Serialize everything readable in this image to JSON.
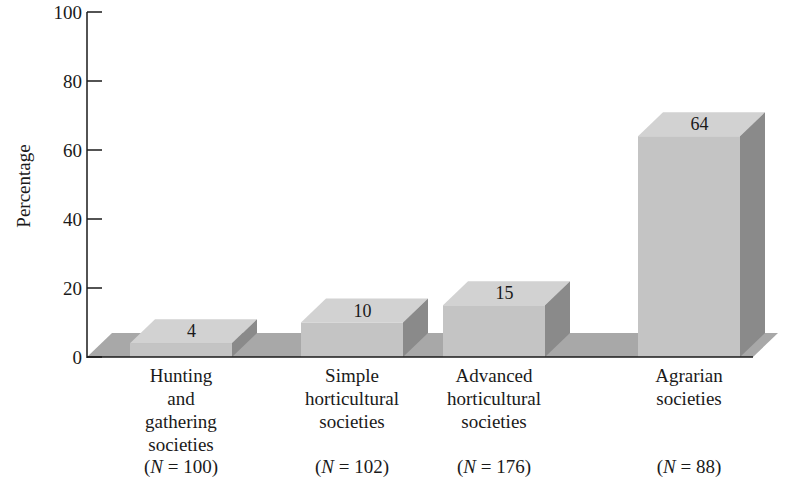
{
  "chart_data": {
    "type": "bar",
    "style": "3d",
    "title": "",
    "xlabel": "",
    "ylabel": "Percentage",
    "ylim": [
      0,
      100
    ],
    "yticks": [
      0,
      20,
      40,
      60,
      80,
      100
    ],
    "grid": false,
    "legend": null,
    "categories": [
      "Hunting and gathering societies",
      "Simple horticultural societies",
      "Advanced horticultural societies",
      "Agrarian societies"
    ],
    "category_lines": [
      [
        "Hunting",
        "and",
        "gathering",
        "societies"
      ],
      [
        "Simple",
        "horticultural",
        "societies"
      ],
      [
        "Advanced",
        "horticultural",
        "societies"
      ],
      [
        "Agrarian",
        "societies"
      ]
    ],
    "sample_sizes": [
      100,
      102,
      176,
      88
    ],
    "values": [
      4,
      10,
      15,
      64
    ],
    "data_labels": [
      "4",
      "10",
      "15",
      "64"
    ]
  },
  "colors": {
    "bar_front": "#c4c4c4",
    "bar_top": "#d2d2d2",
    "bar_side": "#8a8a8a",
    "floor": "#a8a8a8",
    "axis": "#1a1a1a"
  }
}
